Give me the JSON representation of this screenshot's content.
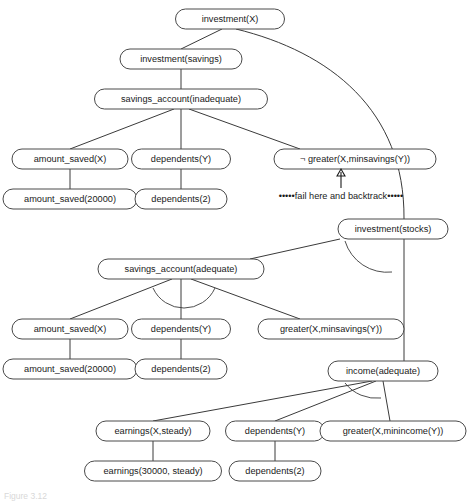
{
  "figure": {
    "background": "#ffffff",
    "line_color": "#3a3a3a",
    "text_color": "#1a1a1a",
    "caption": "Figure 3.12"
  },
  "nodes": [
    {
      "id": "investment_x",
      "label": "investment(X)",
      "cx": 230,
      "cy": 19,
      "w": 109,
      "h": 20
    },
    {
      "id": "investment_savings",
      "label": "investment(savings)",
      "cx": 181,
      "cy": 59,
      "w": 122,
      "h": 20
    },
    {
      "id": "savings_account_inad",
      "label": "savings_account(inadequate)",
      "cx": 181,
      "cy": 99,
      "w": 173,
      "h": 20
    },
    {
      "id": "amount_saved_x_1",
      "label": "amount_saved(X)",
      "cx": 70,
      "cy": 159,
      "w": 116,
      "h": 20
    },
    {
      "id": "dependents_y_1",
      "label": "dependents(Y)",
      "cx": 181,
      "cy": 159,
      "w": 99,
      "h": 20
    },
    {
      "id": "not_greater_minsavings",
      "label": "¬ greater(X,minsavings(Y))",
      "cx": 355,
      "cy": 159,
      "w": 162,
      "h": 20
    },
    {
      "id": "amount_saved_20000_1",
      "label": "amount_saved(20000)",
      "cx": 70,
      "cy": 199,
      "w": 134,
      "h": 20
    },
    {
      "id": "dependents_2_1",
      "label": "dependents(2)",
      "cx": 181,
      "cy": 199,
      "w": 92,
      "h": 20
    },
    {
      "id": "investment_stocks",
      "label": "investment(stocks)",
      "cx": 393,
      "cy": 229,
      "w": 110,
      "h": 20
    },
    {
      "id": "savings_account_adeq",
      "label": "savings_account(adequate)",
      "cx": 181,
      "cy": 269,
      "w": 166,
      "h": 20
    },
    {
      "id": "amount_saved_x_2",
      "label": "amount_saved(X)",
      "cx": 70,
      "cy": 329,
      "w": 116,
      "h": 20
    },
    {
      "id": "dependents_y_2",
      "label": "dependents(Y)",
      "cx": 181,
      "cy": 329,
      "w": 99,
      "h": 20
    },
    {
      "id": "greater_minsavings",
      "label": "greater(X,minsavings(Y))",
      "cx": 331,
      "cy": 329,
      "w": 146,
      "h": 20
    },
    {
      "id": "amount_saved_20000_2",
      "label": "amount_saved(20000)",
      "cx": 70,
      "cy": 369,
      "w": 134,
      "h": 20
    },
    {
      "id": "dependents_2_2",
      "label": "dependents(2)",
      "cx": 181,
      "cy": 369,
      "w": 92,
      "h": 20
    },
    {
      "id": "income_adequate",
      "label": "income(adequate)",
      "cx": 383,
      "cy": 371,
      "w": 110,
      "h": 20
    },
    {
      "id": "earnings_x_steady",
      "label": "earnings(X,steady)",
      "cx": 153,
      "cy": 431,
      "w": 114,
      "h": 20
    },
    {
      "id": "dependents_y_3",
      "label": "dependents(Y)",
      "cx": 275,
      "cy": 431,
      "w": 99,
      "h": 20
    },
    {
      "id": "greater_minincome",
      "label": "greater(X,minincome(Y))",
      "cx": 393,
      "cy": 431,
      "w": 146,
      "h": 20
    },
    {
      "id": "earnings_30000_steady",
      "label": "earnings(30000, steady)",
      "cx": 153,
      "cy": 471,
      "w": 137,
      "h": 20
    },
    {
      "id": "dependents_2_3",
      "label": "dependents(2)",
      "cx": 275,
      "cy": 471,
      "w": 92,
      "h": 20
    }
  ],
  "annotation": {
    "fail_label": "•••••fail here and backtrack•••••",
    "fail_x": 341,
    "fail_y": 196
  }
}
